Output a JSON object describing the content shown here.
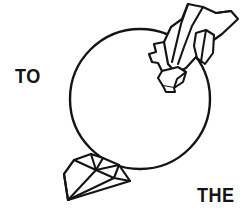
{
  "image": {
    "kind": "line-art-illustration",
    "subject": "circle with crystal clusters",
    "width": 250,
    "height": 218,
    "background_color": "#ffffff",
    "ink_color": "#141414"
  },
  "text": {
    "left_word": "TO",
    "bottom_right_word": "THE"
  },
  "shapes": {
    "sphere": {
      "name": "circle-outline",
      "center_x": 140,
      "center_y": 99,
      "radius": 70,
      "stroke_width": 2.4,
      "fill": "none"
    },
    "crystal_top_right": {
      "name": "crystal-cluster-upper-right",
      "stroke_width": 2.2,
      "fill": "#ffffff"
    },
    "crystal_bottom_left": {
      "name": "crystal-cluster-lower-left",
      "stroke_width": 2.2,
      "fill": "#ffffff"
    }
  }
}
